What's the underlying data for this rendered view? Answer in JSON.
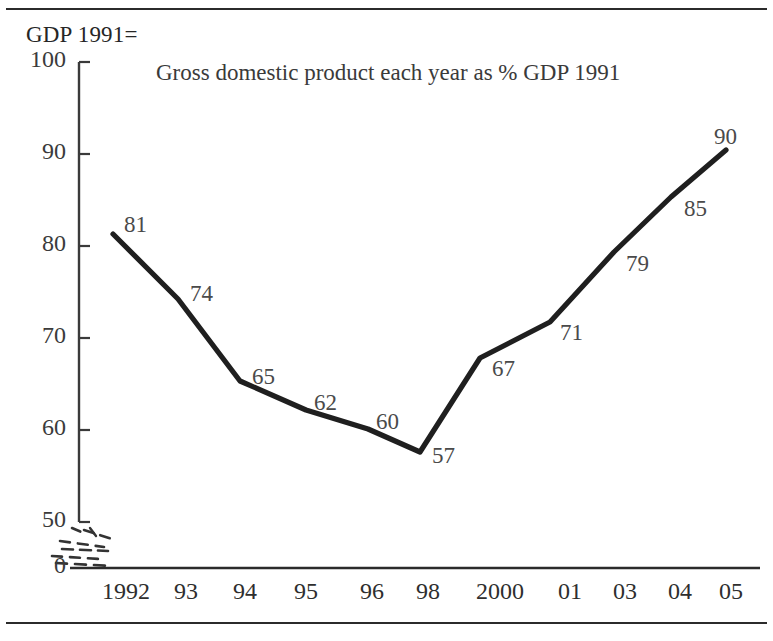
{
  "figure": {
    "axis_caption": "GDP 1991=",
    "title": "Gross domestic product each year as % GDP 1991",
    "line_color": "#1f1f1f",
    "text_color": "#2e2e2e",
    "background": "#ffffff"
  },
  "chart_data": {
    "type": "line",
    "title": "Gross domestic product each year as % GDP 1991",
    "xlabel": "",
    "ylabel": "GDP 1991=",
    "categories": [
      "1992",
      "93",
      "94",
      "95",
      "96",
      "98",
      "2000",
      "01",
      "03",
      "04",
      "05"
    ],
    "values": [
      81,
      74,
      65,
      62,
      60,
      57,
      67,
      71,
      79,
      85,
      90
    ],
    "data_labels": [
      "81",
      "74",
      "65",
      "62",
      "60",
      "57",
      "67",
      "71",
      "79",
      "85",
      "90"
    ],
    "ylim": [
      50,
      100
    ],
    "yticks": [
      50,
      60,
      70,
      80,
      90,
      100
    ],
    "ytick_labels": [
      "50",
      "60",
      "70",
      "80",
      "90",
      "100"
    ],
    "y_zero_label": "0",
    "axis_break": true,
    "axis_break_note": "broken y-axis between 0 and 50",
    "grid": false,
    "legend": false,
    "series": [
      {
        "name": "GDP as % of 1991",
        "values": [
          81,
          74,
          65,
          62,
          60,
          57,
          67,
          71,
          79,
          85,
          90
        ]
      }
    ]
  },
  "y_axis": {
    "ticks": [
      {
        "label": "100",
        "y": 62
      },
      {
        "label": "90",
        "y": 154
      },
      {
        "label": "80",
        "y": 246
      },
      {
        "label": "70",
        "y": 338
      },
      {
        "label": "60",
        "y": 430
      },
      {
        "label": "50",
        "y": 522
      },
      {
        "label": "0",
        "y": 568
      }
    ]
  },
  "x_axis": {
    "ticks": [
      {
        "label": "1992",
        "x": 126
      },
      {
        "label": "93",
        "x": 186
      },
      {
        "label": "94",
        "x": 245
      },
      {
        "label": "95",
        "x": 306
      },
      {
        "label": "96",
        "x": 372
      },
      {
        "label": "98",
        "x": 428
      },
      {
        "label": "2000",
        "x": 500
      },
      {
        "label": "01",
        "x": 570
      },
      {
        "label": "03",
        "x": 625
      },
      {
        "label": "04",
        "x": 680
      },
      {
        "label": "05",
        "x": 731
      }
    ]
  },
  "points": [
    {
      "label": "81",
      "px": 113,
      "py": 234,
      "lx": 126,
      "ly": 213
    },
    {
      "label": "74",
      "px": 178,
      "py": 299,
      "lx": 190,
      "ly": 278
    },
    {
      "label": "94",
      "px": 0,
      "py": 0,
      "lx": 0,
      "ly": 0
    }
  ],
  "series_points": [
    {
      "value": 81,
      "px": 113,
      "py": 234,
      "label_x": 124,
      "label_y": 212
    },
    {
      "value": 74,
      "px": 178,
      "py": 299,
      "label_x": 190,
      "label_y": 281
    },
    {
      "value": 65,
      "px": 240,
      "py": 381,
      "label_x": 252,
      "label_y": 364
    },
    {
      "value": 62,
      "px": 306,
      "py": 410,
      "label_x": 314,
      "label_y": 390
    },
    {
      "value": 60,
      "px": 368,
      "py": 429,
      "label_x": 376,
      "label_y": 409
    },
    {
      "value": 57,
      "px": 420,
      "py": 452,
      "label_x": 432,
      "label_y": 443
    },
    {
      "value": 67,
      "px": 480,
      "py": 358,
      "label_x": 492,
      "label_y": 356
    },
    {
      "value": 71,
      "px": 550,
      "py": 322,
      "label_x": 560,
      "label_y": 320
    },
    {
      "value": 79,
      "px": 614,
      "py": 252,
      "label_x": 626,
      "label_y": 251
    },
    {
      "value": 85,
      "px": 671,
      "py": 197,
      "label_x": 684,
      "label_y": 196
    },
    {
      "value": 90,
      "px": 726,
      "py": 150,
      "label_x": 714,
      "label_y": 124
    }
  ]
}
